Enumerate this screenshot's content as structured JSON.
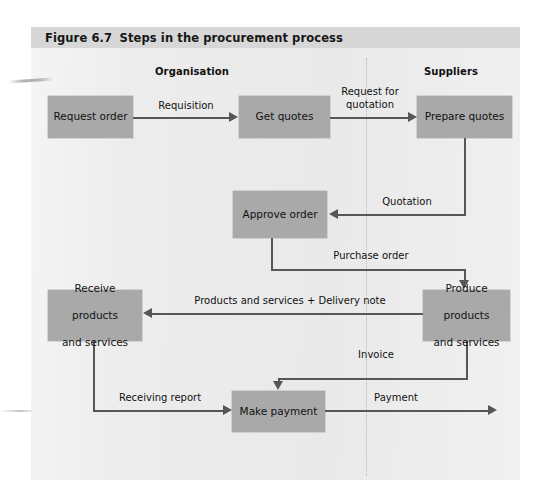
{
  "figure": {
    "number": "Figure 6.7",
    "title": "Steps in the procurement process"
  },
  "lanes": [
    {
      "id": "organisation",
      "label": "Organisation"
    },
    {
      "id": "suppliers",
      "label": "Suppliers"
    }
  ],
  "nodes": [
    {
      "id": "request-order",
      "label": "Request order"
    },
    {
      "id": "get-quotes",
      "label": "Get quotes"
    },
    {
      "id": "prepare-quotes",
      "label": "Prepare quotes"
    },
    {
      "id": "approve-order",
      "label": "Approve order"
    },
    {
      "id": "receive-products",
      "line1": "Receive",
      "line2": "products",
      "line3": "and services"
    },
    {
      "id": "produce-products",
      "line1": "Produce",
      "line2": "products",
      "line3": "and services"
    },
    {
      "id": "make-payment",
      "label": "Make payment"
    }
  ],
  "edges": [
    {
      "id": "requisition",
      "label": "Requisition"
    },
    {
      "id": "request-for-quotation",
      "line1": "Request for",
      "line2": "quotation"
    },
    {
      "id": "quotation",
      "label": "Quotation"
    },
    {
      "id": "purchase-order",
      "label": "Purchase order"
    },
    {
      "id": "delivery",
      "label": "Products and services + Delivery note"
    },
    {
      "id": "invoice",
      "label": "Invoice"
    },
    {
      "id": "receiving-report",
      "label": "Receiving report"
    },
    {
      "id": "payment",
      "label": "Payment"
    }
  ],
  "colors": {
    "page_background": "#ffffff",
    "panel_background": "#ececec",
    "caption_bar": "#d7d7d7",
    "node_fill": "#a9a9a9",
    "connector": "#565656",
    "divider": "#b6b6b6",
    "text": "#121212"
  }
}
